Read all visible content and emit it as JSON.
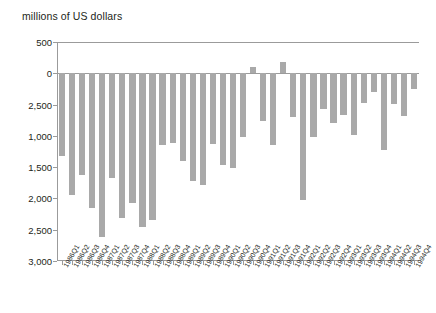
{
  "figure": {
    "axis_title": "millions of US dollars",
    "bar_color": "#a9a9a9",
    "axis_color": "#9b9b9b",
    "text_color": "#231f20"
  },
  "chart_data": {
    "type": "bar",
    "title": "",
    "subtitle": "",
    "xlabel": "",
    "ylabel": "millions of US dollars",
    "ylim": [
      -3000,
      500
    ],
    "grid": false,
    "legend": null,
    "ytick_labels": [
      "500",
      "0",
      "2,500",
      "1,000",
      "1,500",
      "2,000",
      "2,500",
      "3,000"
    ],
    "ytick_values": [
      500,
      0,
      -500,
      -1000,
      -1500,
      -2000,
      -2500,
      -3000
    ],
    "ytick_note": "third label printed as '2,500' in the source; position corresponds to -500",
    "categories": [
      "1986Q1",
      "1986Q2",
      "1986Q3",
      "1986Q4",
      "1987Q1",
      "1987Q2",
      "1987Q3",
      "1987Q4",
      "1988Q1",
      "1988Q2",
      "1988Q3",
      "1988Q4",
      "1989Q1",
      "1989Q2",
      "1989Q3",
      "1989Q4",
      "1990Q1",
      "1990Q2",
      "1990Q3",
      "1990Q4",
      "1991Q1",
      "1991Q2",
      "1991Q3",
      "1991Q4",
      "1992Q1",
      "1992Q2",
      "1992Q3",
      "1992Q4",
      "1993Q1",
      "1993Q2",
      "1993Q3",
      "1993Q4",
      "1994Q1",
      "1994Q2",
      "1994Q3",
      "1994Q4"
    ],
    "values": [
      -1320,
      -1950,
      -1620,
      -2150,
      -2620,
      -1680,
      -2310,
      -2080,
      -2450,
      -2350,
      -1150,
      -1120,
      -1400,
      -1720,
      -1780,
      -1130,
      -1470,
      -1520,
      -1020,
      100,
      -760,
      -1140,
      180,
      -700,
      -2020,
      -1020,
      -570,
      -800,
      -660,
      -990,
      -470,
      -300,
      -1220,
      -490,
      -680,
      -250
    ]
  }
}
